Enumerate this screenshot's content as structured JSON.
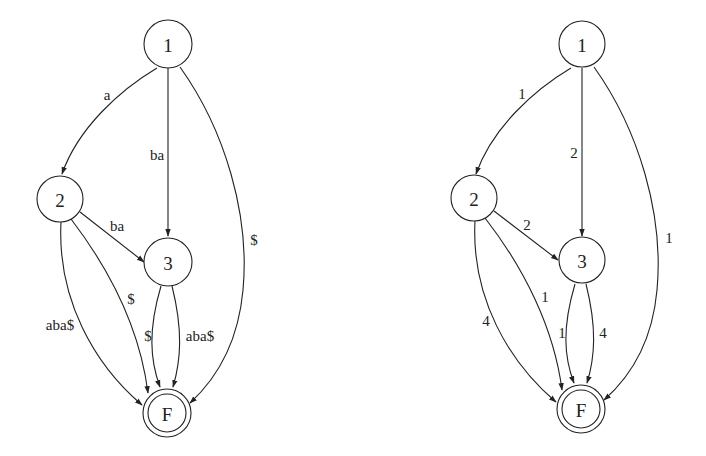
{
  "diagrams": [
    {
      "name": "string-labeled-dag",
      "nodes": [
        {
          "id": "1",
          "label": "1"
        },
        {
          "id": "2",
          "label": "2"
        },
        {
          "id": "3",
          "label": "3"
        },
        {
          "id": "F",
          "label": "F",
          "final": true
        }
      ],
      "edges": [
        {
          "from": "1",
          "to": "2",
          "label": "a"
        },
        {
          "from": "1",
          "to": "3",
          "label": "ba"
        },
        {
          "from": "1",
          "to": "F",
          "label": "$"
        },
        {
          "from": "2",
          "to": "3",
          "label": "ba"
        },
        {
          "from": "2",
          "to": "F",
          "label": "$"
        },
        {
          "from": "2",
          "to": "F",
          "label": "aba$"
        },
        {
          "from": "3",
          "to": "F",
          "label": "$"
        },
        {
          "from": "3",
          "to": "F",
          "label": "aba$"
        }
      ]
    },
    {
      "name": "length-labeled-dag",
      "nodes": [
        {
          "id": "1",
          "label": "1"
        },
        {
          "id": "2",
          "label": "2"
        },
        {
          "id": "3",
          "label": "3"
        },
        {
          "id": "F",
          "label": "F",
          "final": true
        }
      ],
      "edges": [
        {
          "from": "1",
          "to": "2",
          "label": "1"
        },
        {
          "from": "1",
          "to": "3",
          "label": "2"
        },
        {
          "from": "1",
          "to": "F",
          "label": "1"
        },
        {
          "from": "2",
          "to": "3",
          "label": "2"
        },
        {
          "from": "2",
          "to": "F",
          "label": "1"
        },
        {
          "from": "2",
          "to": "F",
          "label": "4"
        },
        {
          "from": "3",
          "to": "F",
          "label": "1"
        },
        {
          "from": "3",
          "to": "F",
          "label": "4"
        }
      ]
    }
  ]
}
